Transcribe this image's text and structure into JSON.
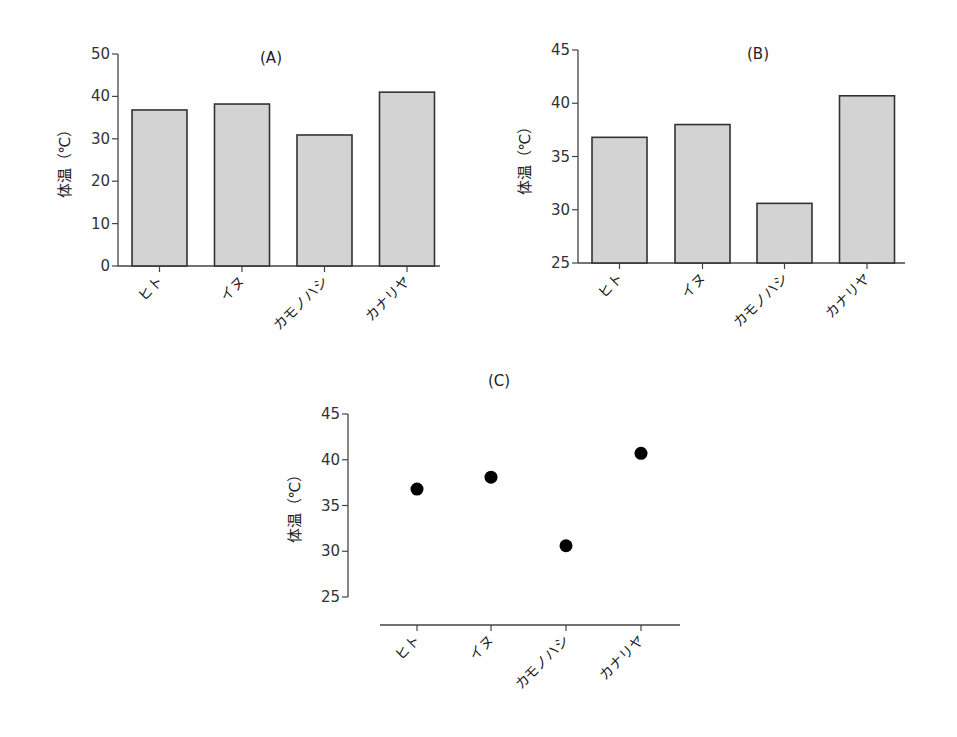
{
  "chart_data": [
    {
      "id": "A",
      "type": "bar",
      "title": "(A)",
      "xlabel": "",
      "ylabel": "体温（℃）",
      "categories": [
        "ヒト",
        "イヌ",
        "カモノハシ",
        "カナリヤ"
      ],
      "values": [
        36.8,
        38.2,
        30.9,
        41.0
      ],
      "ylim": [
        0,
        50
      ],
      "yticks": [
        0,
        10,
        20,
        30,
        40,
        50
      ],
      "grid": false,
      "legend": null,
      "bar_color": "#d3d3d3",
      "edge_color": "#333333"
    },
    {
      "id": "B",
      "type": "bar",
      "title": "(B)",
      "xlabel": "",
      "ylabel": "体温（℃）",
      "categories": [
        "ヒト",
        "イヌ",
        "カモノハシ",
        "カナリヤ"
      ],
      "values": [
        36.8,
        38.0,
        30.6,
        40.7
      ],
      "ylim": [
        25,
        45
      ],
      "yticks": [
        25,
        30,
        35,
        40,
        45
      ],
      "grid": false,
      "legend": null,
      "bar_color": "#d3d3d3",
      "edge_color": "#333333"
    },
    {
      "id": "C",
      "type": "scatter",
      "title": "(C)",
      "xlabel": "",
      "ylabel": "体温（℃）",
      "categories": [
        "ヒト",
        "イヌ",
        "カモノハシ",
        "カナリヤ"
      ],
      "values": [
        36.8,
        38.1,
        30.6,
        40.7
      ],
      "ylim": [
        25,
        45
      ],
      "yticks": [
        25,
        30,
        35,
        40,
        45
      ],
      "grid": false,
      "legend": null,
      "marker_color": "#000000"
    }
  ]
}
